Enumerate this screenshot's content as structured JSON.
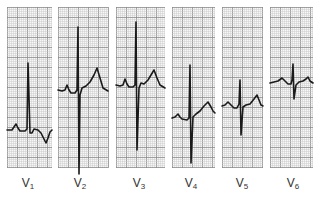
{
  "figure": {
    "grid": {
      "minor_spacing": 2,
      "major_spacing": 10,
      "minor_color": "#c8c8c8",
      "major_color": "#8a8a8a"
    },
    "trace_color": "#1a1a1a",
    "leads": [
      {
        "name": "V",
        "sub": "1",
        "x": 7,
        "w": 45,
        "top": 7,
        "bottom": 168,
        "label_x": 28,
        "path": "M7,130 L12,130 L14,127 L16,124 L18,128 L20,131 L25,131 L27,129 L28,63 L30,133 L32,133 L34,129 L38,130 L41,133 L44,139 L46,143 L48,138 L50,132 L52,130"
      },
      {
        "name": "V",
        "sub": "2",
        "x": 58,
        "w": 50,
        "top": 7,
        "bottom": 168,
        "label_x": 80,
        "path": "M58,90 L62,91 L65,90 L67,85 L69,90 L71,93 L75,93 L77,90 L78,27 L79,174 L80,95 L82,88 L86,86 L90,82 L94,75 L97,68 L100,78 L103,88 L108,91"
      },
      {
        "name": "V",
        "sub": "3",
        "x": 116,
        "w": 49,
        "top": 7,
        "bottom": 168,
        "label_x": 139,
        "path": "M116,85 L120,86 L123,85 L125,79 L127,84 L129,87 L133,87 L135,85 L136,22 L137,150 L139,88 L141,83 L144,84 L148,80 L151,75 L154,70 L157,78 L160,85 L165,88"
      },
      {
        "name": "V",
        "sub": "4",
        "x": 172,
        "w": 43,
        "top": 7,
        "bottom": 168,
        "label_x": 191,
        "path": "M172,118 L175,117 L178,114 L180,117 L182,119 L187,120 L189,118 L190,65 L191,163 L193,117 L196,114 L200,111 L204,106 L208,102 L211,107 L213,111 L215,113"
      },
      {
        "name": "V",
        "sub": "5",
        "x": 222,
        "w": 41,
        "top": 7,
        "bottom": 168,
        "label_x": 242,
        "path": "M222,106 L225,105 L228,102 L231,105 L234,108 L237,108 L239,104 L240,80 L241,135 L243,107 L246,105 L250,104 L254,99 L257,95 L259,100 L261,105 L263,106"
      },
      {
        "name": "V",
        "sub": "6",
        "x": 270,
        "w": 43,
        "top": 7,
        "bottom": 168,
        "label_x": 293,
        "path": "M270,83 L274,82 L278,81 L282,78 L285,81 L288,84 L291,84 L292,80 L293,64 L294,99 L296,85 L299,82 L303,81 L306,79 L308,77 L310,81 L313,83"
      }
    ]
  }
}
